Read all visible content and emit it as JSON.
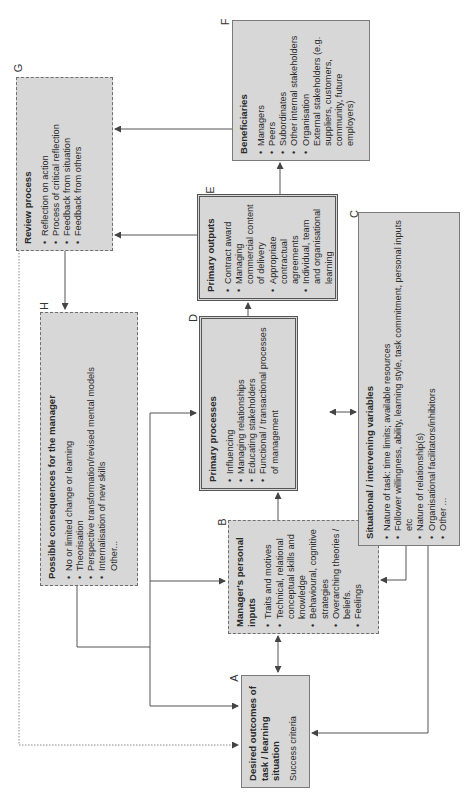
{
  "diagram": {
    "orientation": "rotated 90deg counter-clockwise",
    "boxes": {
      "A": {
        "letter": "A",
        "title": "Desired outcomes of task / learning situation",
        "subtitle": "Success criteria"
      },
      "B": {
        "letter": "B",
        "title": "Manager's personal inputs",
        "items": [
          "Traits and motives",
          "Technical, relational conceptual skills and knowledge",
          "Behavioural, cognitive strategies",
          "Overarching theories / beliefs.",
          "Feelings"
        ]
      },
      "C": {
        "letter": "C",
        "title": "Situational / intervening variables",
        "items": [
          "Nature of task: time limits; available resources",
          "Follower willingness, ability, learning style, task commitment, personal inputs etc",
          "Nature of relationship(s)",
          "Organisational facilitators/inhibitors",
          "Other ..."
        ]
      },
      "D": {
        "letter": "D",
        "title": "Primary processes",
        "items": [
          "Influencing",
          "Managing relationships",
          "Educating stakeholders"
        ],
        "items_2": [
          "Functional / transactional processes of management"
        ]
      },
      "E": {
        "letter": "E",
        "title": "Primary outputs",
        "items": [
          "Contract award",
          "Managing commercial content of delivery",
          "Appropriate contractual agreements",
          "Individual, team and organisational learning"
        ]
      },
      "F": {
        "letter": "F",
        "title": "Beneficiaries",
        "items": [
          "Managers",
          "Peers",
          "Subordinates",
          "Other internal stakeholders",
          "Organisation"
        ],
        "extra": "External stakeholders (e.g. suppliers, customers, community, future employers)"
      },
      "G": {
        "letter": "G",
        "title": "Review process",
        "items": [
          "Reflection on action",
          "Process of critical reflection",
          "Feedback from situation",
          "Feedback from others"
        ]
      },
      "H": {
        "letter": "H",
        "title": "Possible consequences for the manager",
        "items": [
          "No or limited change or learning",
          "Theorisation",
          "Perspective transformation/revised mental models",
          "Internalisation of new skills"
        ],
        "extra": "Other..."
      }
    },
    "colors": {
      "box_fill": "#d7d7d7",
      "line": "#555555",
      "background": "#ffffff"
    }
  }
}
